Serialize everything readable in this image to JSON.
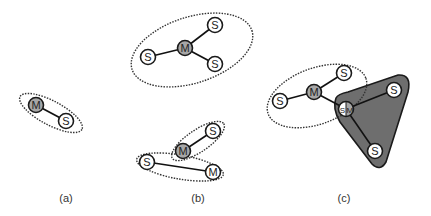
{
  "colors": {
    "node_stroke": "#1a1a1a",
    "master_fill": "#a6a6a6",
    "slave_fill": "#ffffff",
    "region_fill": "#6e6e6e",
    "dotted_stroke": "#333333",
    "label_color": "#333333"
  },
  "panels": [
    {
      "id": "a",
      "label": "(a)",
      "label_pos": [
        66,
        202
      ],
      "nodes": [
        {
          "id": "a-M",
          "text": "M",
          "role": "master",
          "x": 36,
          "y": 105
        },
        {
          "id": "a-S",
          "text": "S",
          "role": "slave",
          "x": 66,
          "y": 121
        }
      ]
    },
    {
      "id": "b",
      "label": "(b)",
      "label_pos": [
        198,
        202
      ],
      "nodes": [
        {
          "id": "b1-M",
          "text": "M",
          "role": "master",
          "x": 185,
          "y": 48
        },
        {
          "id": "b1-S1",
          "text": "S",
          "role": "slave",
          "x": 148,
          "y": 57
        },
        {
          "id": "b1-S2",
          "text": "S",
          "role": "slave",
          "x": 215,
          "y": 25
        },
        {
          "id": "b1-S3",
          "text": "S",
          "role": "slave",
          "x": 215,
          "y": 64
        },
        {
          "id": "b2-S1",
          "text": "S",
          "role": "slave",
          "x": 213,
          "y": 131
        },
        {
          "id": "b2-M1",
          "text": "M",
          "role": "master",
          "x": 183,
          "y": 151
        },
        {
          "id": "b2-S2",
          "text": "S",
          "role": "slave",
          "x": 147,
          "y": 162
        },
        {
          "id": "b2-M2",
          "text": "M",
          "role": "master-unshaded",
          "x": 213,
          "y": 172
        }
      ]
    },
    {
      "id": "c",
      "label": "(c)",
      "label_pos": [
        344,
        202
      ],
      "nodes": [
        {
          "id": "c-S1",
          "text": "S",
          "role": "slave",
          "x": 280,
          "y": 101
        },
        {
          "id": "c-M",
          "text": "M",
          "role": "master",
          "x": 314,
          "y": 92
        },
        {
          "id": "c-S2",
          "text": "S",
          "role": "slave",
          "x": 344,
          "y": 73
        },
        {
          "id": "c-SM",
          "text_left": "S",
          "text_right": "M",
          "role": "slave-master",
          "x": 346,
          "y": 109
        },
        {
          "id": "c-S3",
          "text": "S",
          "role": "slave",
          "x": 394,
          "y": 90
        },
        {
          "id": "c-S4",
          "text": "S",
          "role": "slave",
          "x": 375,
          "y": 151
        }
      ]
    }
  ]
}
